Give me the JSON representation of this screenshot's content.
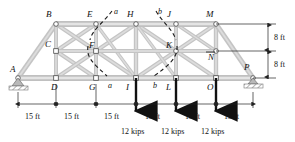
{
  "figure": {
    "type": "truss-free-body-diagram",
    "colors": {
      "member_fill": "#c9c9c9",
      "member_edge": "#8f8f8f",
      "node_fill": "#ffffff",
      "node_edge": "#555555",
      "line": "#222222",
      "load_arrow": "#111111",
      "section_cut": "#1a1a1a",
      "support_hatch": "#9a9a9a"
    },
    "joint_labels": [
      {
        "id": "A",
        "text": "A",
        "x": 10,
        "y": 70
      },
      {
        "id": "B",
        "text": "B",
        "x": 46,
        "y": 15
      },
      {
        "id": "C",
        "text": "C",
        "x": 48,
        "y": 44
      },
      {
        "id": "D",
        "text": "D",
        "x": 50,
        "y": 86
      },
      {
        "id": "E",
        "text": "E",
        "x": 86,
        "y": 15
      },
      {
        "id": "F",
        "text": "F",
        "x": 91,
        "y": 47
      },
      {
        "id": "G",
        "text": "G",
        "x": 86,
        "y": 86
      },
      {
        "id": "H",
        "text": "H",
        "x": 126,
        "y": 15
      },
      {
        "id": "I",
        "text": "I",
        "x": 127,
        "y": 86
      },
      {
        "id": "J",
        "text": "J",
        "x": 165,
        "y": 15
      },
      {
        "id": "K",
        "text": "K",
        "x": 168,
        "y": 47
      },
      {
        "id": "L",
        "text": "L",
        "x": 166,
        "y": 86
      },
      {
        "id": "M",
        "text": "M",
        "x": 205,
        "y": 15
      },
      {
        "id": "N",
        "text": "N",
        "x": 208,
        "y": 52
      },
      {
        "id": "O",
        "text": "O",
        "x": 206,
        "y": 86
      },
      {
        "id": "P",
        "text": "P",
        "x": 244,
        "y": 66
      }
    ],
    "section_cuts": [
      {
        "name": "a",
        "top_label": "a",
        "bottom_label": "a"
      },
      {
        "name": "b",
        "top_label": "b",
        "bottom_label": "b"
      }
    ],
    "loads": [
      {
        "joint": "I",
        "label": "12 kips",
        "magnitude": 12,
        "unit": "kips",
        "direction": "down"
      },
      {
        "joint": "L",
        "label": "12 kips",
        "magnitude": 12,
        "unit": "kips",
        "direction": "down"
      },
      {
        "joint": "O",
        "label": "12 kips",
        "magnitude": 12,
        "unit": "kips",
        "direction": "down"
      }
    ],
    "horizontal_dimensions": [
      {
        "label": "15 ft",
        "value": 15,
        "unit": "ft",
        "from": "A",
        "to": "D"
      },
      {
        "label": "15 ft",
        "value": 15,
        "unit": "ft",
        "from": "D",
        "to": "G"
      },
      {
        "label": "15 ft",
        "value": 15,
        "unit": "ft",
        "from": "G",
        "to": "I"
      },
      {
        "label": "15 ft",
        "value": 15,
        "unit": "ft",
        "from": "I",
        "to": "L"
      },
      {
        "label": "15 ft",
        "value": 15,
        "unit": "ft",
        "from": "L",
        "to": "O"
      },
      {
        "label": "15 ft",
        "value": 15,
        "unit": "ft",
        "from": "O",
        "to": "P"
      }
    ],
    "vertical_dimensions": [
      {
        "label": "8 ft",
        "value": 8,
        "unit": "ft",
        "from": "top-chord",
        "to": "mid-chord"
      },
      {
        "label": "8 ft",
        "value": 8,
        "unit": "ft",
        "from": "mid-chord",
        "to": "bottom-chord"
      }
    ],
    "supports": [
      {
        "joint": "A",
        "type": "pin"
      },
      {
        "joint": "P",
        "type": "roller"
      }
    ]
  }
}
